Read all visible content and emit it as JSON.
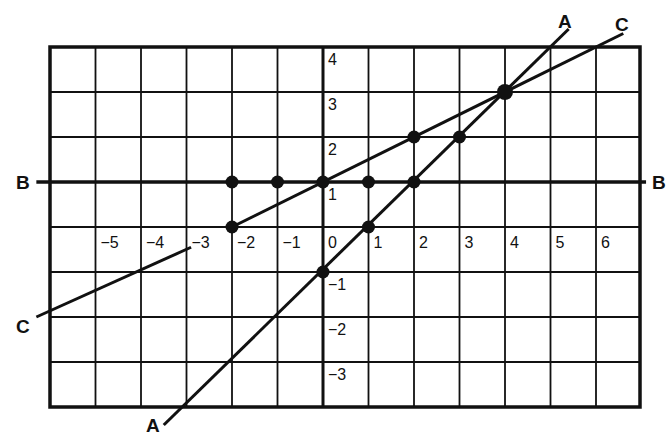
{
  "chart_data": {
    "type": "line",
    "title": "",
    "xlabel": "",
    "ylabel": "",
    "xlim": [
      -6,
      7
    ],
    "ylim": [
      -4,
      4
    ],
    "grid": true,
    "x_ticks": [
      "-5",
      "-4",
      "-3",
      "-2",
      "-1",
      "0",
      "1",
      "2",
      "3",
      "4",
      "5",
      "6"
    ],
    "y_ticks": [
      "4",
      "3",
      "2",
      "1",
      "-1",
      "-2",
      "-3"
    ],
    "series": [
      {
        "name": "A",
        "equation": "y = x - 1",
        "points": [
          [
            0,
            -1
          ],
          [
            1,
            0
          ],
          [
            2,
            1
          ],
          [
            3,
            2
          ],
          [
            4,
            3
          ]
        ],
        "extent": [
          [
            -3.5,
            -4.4
          ],
          [
            5.4,
            4.4
          ]
        ]
      },
      {
        "name": "B",
        "equation": "y = 1",
        "points": [
          [
            -2,
            1
          ],
          [
            -1,
            1
          ],
          [
            0,
            1
          ],
          [
            1,
            1
          ],
          [
            2,
            1
          ]
        ],
        "extent": [
          [
            -6.3,
            1
          ],
          [
            7.1,
            1
          ]
        ]
      },
      {
        "name": "C",
        "equation": "y = x/2 + 1",
        "points": [
          [
            -2,
            0
          ],
          [
            0,
            1
          ],
          [
            2,
            2
          ],
          [
            4,
            3
          ]
        ],
        "extent": [
          [
            -6.3,
            -2.0
          ],
          [
            6.6,
            4.3
          ]
        ]
      }
    ],
    "intersection": {
      "series": [
        "A",
        "C"
      ],
      "point": [
        4,
        3
      ]
    }
  },
  "labels": {
    "line_a_top": "A",
    "line_a_bottom": "A",
    "line_b_left": "B",
    "line_b_right": "B",
    "line_c_top": "C",
    "line_c_bottom": "C"
  }
}
